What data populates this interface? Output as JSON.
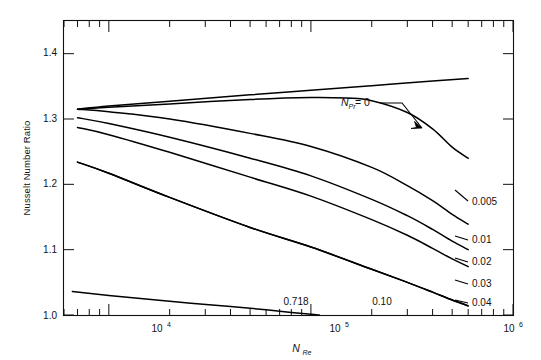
{
  "chart_data": {
    "type": "line",
    "title": "",
    "xlabel": "N_Re",
    "xlabel_base": "N",
    "xlabel_sub": "Re",
    "ylabel": "Nusselt Number Ratio",
    "xscale": "log",
    "yscale": "linear",
    "xlim": [
      6000,
      1000000
    ],
    "ylim": [
      1.0,
      1.45
    ],
    "xticks": [
      10000,
      100000,
      1000000
    ],
    "xticklabels": [
      "10⁴",
      "10⁵",
      "10⁶"
    ],
    "xticklabel_base": "10",
    "xticklabel_exponents": [
      "4",
      "5",
      "6"
    ],
    "yticks": [
      1.0,
      1.1,
      1.2,
      1.3,
      1.4
    ],
    "yticklabels": [
      "1.0",
      "1.1",
      "1.2",
      "1.3",
      "1.4"
    ],
    "grid": false,
    "legend_position": "inline-right",
    "annotation": {
      "text": "N_Pr = 0",
      "text_base": "N",
      "text_sub": "Pr",
      "text_tail": " = 0",
      "points_to_series": "0"
    },
    "series": [
      {
        "name": "0",
        "label": "N_Pr = 0",
        "label_position": "annotation",
        "points": [
          [
            7000,
            1.315
          ],
          [
            10000,
            1.32
          ],
          [
            20000,
            1.327
          ],
          [
            50000,
            1.337
          ],
          [
            100000,
            1.344
          ],
          [
            200000,
            1.351
          ],
          [
            400000,
            1.358
          ],
          [
            600000,
            1.362
          ]
        ]
      },
      {
        "name": "0.005",
        "label": "0.005",
        "label_position": "right",
        "points": [
          [
            7000,
            1.315
          ],
          [
            10000,
            1.318
          ],
          [
            20000,
            1.323
          ],
          [
            50000,
            1.33
          ],
          [
            100000,
            1.333
          ],
          [
            150000,
            1.332
          ],
          [
            200000,
            1.328
          ],
          [
            300000,
            1.31
          ],
          [
            400000,
            1.285
          ],
          [
            500000,
            1.257
          ],
          [
            600000,
            1.24
          ]
        ]
      },
      {
        "name": "0.01",
        "label": "0.01",
        "label_position": "right",
        "points": [
          [
            7000,
            1.315
          ],
          [
            10000,
            1.311
          ],
          [
            20000,
            1.3
          ],
          [
            50000,
            1.278
          ],
          [
            100000,
            1.258
          ],
          [
            200000,
            1.226
          ],
          [
            300000,
            1.198
          ],
          [
            400000,
            1.175
          ],
          [
            500000,
            1.154
          ],
          [
            600000,
            1.139
          ]
        ]
      },
      {
        "name": "0.02",
        "label": "0.02",
        "label_position": "right",
        "points": [
          [
            7000,
            1.302
          ],
          [
            10000,
            1.293
          ],
          [
            20000,
            1.272
          ],
          [
            50000,
            1.24
          ],
          [
            100000,
            1.213
          ],
          [
            200000,
            1.177
          ],
          [
            300000,
            1.152
          ],
          [
            400000,
            1.131
          ],
          [
            500000,
            1.113
          ],
          [
            600000,
            1.1
          ]
        ]
      },
      {
        "name": "0.03",
        "label": "0.03",
        "label_position": "right",
        "points": [
          [
            7000,
            1.287
          ],
          [
            10000,
            1.276
          ],
          [
            20000,
            1.249
          ],
          [
            50000,
            1.211
          ],
          [
            100000,
            1.182
          ],
          [
            200000,
            1.146
          ],
          [
            300000,
            1.122
          ],
          [
            400000,
            1.102
          ],
          [
            500000,
            1.086
          ],
          [
            600000,
            1.074
          ]
        ]
      },
      {
        "name": "0.04",
        "label": "0.04",
        "label_position": "right",
        "points": [
          [
            7000,
            1.234
          ],
          [
            10000,
            1.217
          ],
          [
            20000,
            1.18
          ],
          [
            50000,
            1.134
          ],
          [
            100000,
            1.104
          ],
          [
            200000,
            1.07
          ],
          [
            300000,
            1.05
          ],
          [
            400000,
            1.035
          ],
          [
            500000,
            1.023
          ],
          [
            600000,
            1.014
          ]
        ]
      },
      {
        "name": "0.10",
        "label": "0.10",
        "label_position": "bottom-inline",
        "points": [
          [
            7000,
            1.234
          ],
          [
            10000,
            1.217
          ],
          [
            20000,
            1.18
          ],
          [
            50000,
            1.134
          ],
          [
            100000,
            1.104
          ],
          [
            200000,
            1.07
          ],
          [
            300000,
            1.05
          ],
          [
            400000,
            1.035
          ],
          [
            500000,
            1.023
          ],
          [
            600000,
            1.014
          ]
        ]
      },
      {
        "name": "0.718",
        "label": "0.718",
        "label_position": "bottom-inline",
        "points": [
          [
            6600,
            1.036
          ],
          [
            10000,
            1.03
          ],
          [
            20000,
            1.021
          ],
          [
            40000,
            1.013
          ],
          [
            60000,
            1.008
          ],
          [
            80000,
            1.004
          ],
          [
            100000,
            1.001
          ],
          [
            110000,
            1.0
          ]
        ]
      }
    ]
  },
  "labels": {
    "y_axis_title": "Nusselt Number Ratio",
    "x_axis_title_base": "N",
    "x_axis_title_sub": "Re",
    "annotation_base": "N",
    "annotation_sub": "Pr",
    "annotation_tail": " = 0",
    "curve_0005": "0.005",
    "curve_001": "0.01",
    "curve_002": "0.02",
    "curve_003": "0.03",
    "curve_004": "0.04",
    "curve_010": "0.10",
    "curve_0718": "0.718",
    "ytick_10": "1.0",
    "ytick_11": "1.1",
    "ytick_12": "1.2",
    "ytick_13": "1.3",
    "ytick_14": "1.4",
    "xtick_base": "10",
    "xtick_exp_4": "4",
    "xtick_exp_5": "5",
    "xtick_exp_6": "6"
  },
  "colors": {
    "curve": "#000000",
    "axis": "#111111",
    "background": "#ffffff"
  }
}
